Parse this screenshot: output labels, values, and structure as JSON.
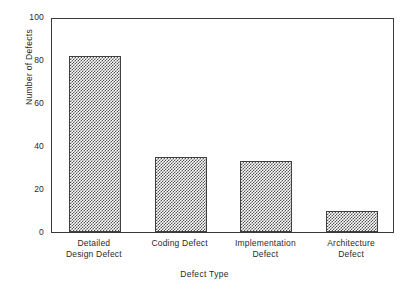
{
  "chart_data": {
    "type": "bar",
    "title": "",
    "subtitle": "",
    "xlabel": "Defect Type",
    "ylabel": "Number of Defects",
    "categories": [
      "Detailed Design Defect",
      "Coding Defect",
      "Implementation Defect",
      "Architecture Defect"
    ],
    "category_lines": [
      [
        "Detailed",
        "Design Defect"
      ],
      [
        "Coding Defect",
        ""
      ],
      [
        "Implementation",
        "Defect"
      ],
      [
        "Architecture",
        "Defect"
      ]
    ],
    "values": [
      82,
      35,
      33,
      10
    ],
    "ylim": [
      0,
      100
    ],
    "yticks": [
      0,
      20,
      40,
      60,
      80,
      100
    ],
    "ytick_labels": [
      "0",
      "20",
      "40",
      "60",
      "80",
      "100"
    ],
    "grid": false,
    "legend": null,
    "bar_fill": "checkerboard-hatch",
    "bar_edge_color": "#404040",
    "axis_color": "#3a3a3a",
    "background": "#ffffff"
  }
}
